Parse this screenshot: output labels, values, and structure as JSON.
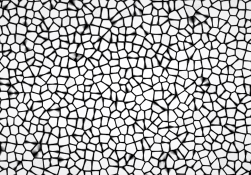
{
  "image": {
    "kind": "micrograph",
    "subject": "polycrystalline-grain-structure",
    "caption": "",
    "width": 251,
    "height": 175,
    "colorspace": "grayscale",
    "has_border": false,
    "has_scale_bar": false,
    "has_labels": false
  },
  "appearance": {
    "background_color": "#f4f4f4",
    "grain_light_color": "#fbfbfb",
    "grain_mid_color": "#d8d8d8",
    "boundary_dark_color": "#1a1a1a",
    "boundary_mid_color": "#4a4a4a",
    "paper_tint": "#f7f6f4",
    "vignette_color": "#000000"
  },
  "chart_data": {
    "type": "heatmap",
    "title": "",
    "xlabel": "",
    "ylabel": "",
    "description": "Grayscale optical micrograph of an equiaxed polycrystalline microstructure: bright white polygonal grains bounded by a connected network of dark etched grain boundaries and triple junctions.",
    "grid": false,
    "legend": false,
    "axis_visible": false,
    "field": {
      "width_px": 251,
      "height_px": 175,
      "seed": 20240517,
      "grain_count": 620,
      "mean_grain_diameter_px": 9.5,
      "grain_diameter_range_px": [
        4,
        18
      ],
      "boundary_thickness_px": [
        1.0,
        2.6
      ],
      "boundary_darkness": 0.86,
      "grain_brightness_mean": 0.95,
      "grain_brightness_spread": 0.1,
      "triple_junction_blob_probability": 0.3,
      "noise_amplitude": 0.055,
      "blur_radius_px": 0.6,
      "contrast": 1.45,
      "gamma": 0.92
    },
    "region_density": [
      {
        "name": "top-left",
        "x": 0,
        "y": 0,
        "w": 125,
        "h": 58,
        "boundary_fraction": 0.4
      },
      {
        "name": "top-right",
        "x": 125,
        "y": 0,
        "w": 126,
        "h": 58,
        "boundary_fraction": 0.33
      },
      {
        "name": "middle-left",
        "x": 0,
        "y": 58,
        "w": 125,
        "h": 59,
        "boundary_fraction": 0.36
      },
      {
        "name": "middle-right",
        "x": 125,
        "y": 58,
        "w": 126,
        "h": 59,
        "boundary_fraction": 0.3
      },
      {
        "name": "bottom-left",
        "x": 0,
        "y": 117,
        "w": 125,
        "h": 58,
        "boundary_fraction": 0.38
      },
      {
        "name": "bottom-right",
        "x": 125,
        "y": 117,
        "w": 126,
        "h": 58,
        "boundary_fraction": 0.29
      }
    ],
    "histogram": {
      "bins": [
        "0-31",
        "32-63",
        "64-95",
        "96-127",
        "128-159",
        "160-191",
        "192-223",
        "224-255"
      ],
      "counts": [
        0.13,
        0.07,
        0.05,
        0.05,
        0.06,
        0.09,
        0.18,
        0.37
      ]
    }
  }
}
